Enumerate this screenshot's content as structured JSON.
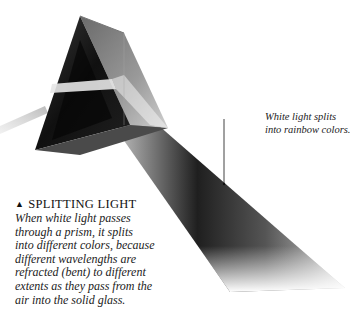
{
  "callout": {
    "lines": [
      "White light splits",
      "into rainbow colors."
    ]
  },
  "caption": {
    "marker": "▲",
    "title": "SPLITTING LIGHT",
    "lines": [
      "When white light passes",
      "through a prism, it splits",
      "into different colors, because",
      "different wavelengths are",
      "refracted (bent) to different",
      "extents as they pass from the",
      "air into the solid glass."
    ]
  },
  "colors": {
    "background": "#ffffff",
    "prism_dark": "#0d0d0d",
    "beam_dark": "#3a3a3a",
    "text": "#1a1a1a"
  }
}
